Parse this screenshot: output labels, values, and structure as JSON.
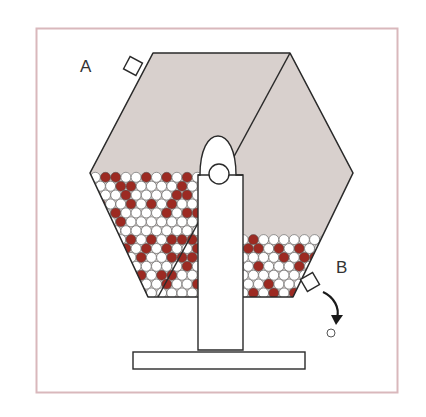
{
  "figure": {
    "labels": {
      "a": "A",
      "b": "B"
    },
    "colors": {
      "frame": "#d9b8bc",
      "drum_fill": "#d8d0cd",
      "outline": "#2a2a2a",
      "ball_red": "#9c2a22",
      "ball_white": "#ffffff"
    },
    "parts": {
      "hatch_a": "inlet hatch A",
      "hatch_b": "outlet hatch B",
      "stand": "support stand",
      "base": "base plate",
      "dispensed_ball": "dispensed ball",
      "arrow": "exit arrow"
    }
  }
}
